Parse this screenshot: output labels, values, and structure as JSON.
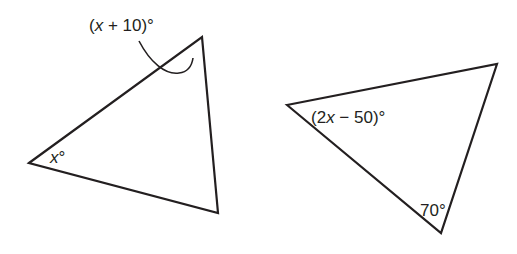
{
  "figures": [
    {
      "id": "triangle-left",
      "vertices": [
        [
          29,
          163
        ],
        [
          202,
          37
        ],
        [
          218,
          213
        ]
      ],
      "angle_labels": [
        {
          "vertex": "top",
          "text": "(x + 10)°",
          "parts": [
            "(",
            "x",
            " + 10)°"
          ],
          "exterior": true
        },
        {
          "vertex": "left",
          "text": "x°",
          "parts": [
            "x",
            "°"
          ]
        }
      ]
    },
    {
      "id": "triangle-right",
      "vertices": [
        [
          287,
          105
        ],
        [
          497,
          64
        ],
        [
          441,
          233
        ]
      ],
      "angle_labels": [
        {
          "vertex": "left",
          "text": "(2x − 50)°",
          "parts": [
            "(2",
            "x",
            " − 50)°"
          ]
        },
        {
          "vertex": "bottom",
          "text": "70°",
          "parts": [
            "70°"
          ]
        }
      ]
    }
  ],
  "colors": {
    "stroke": "#231f20",
    "background": "#ffffff"
  }
}
